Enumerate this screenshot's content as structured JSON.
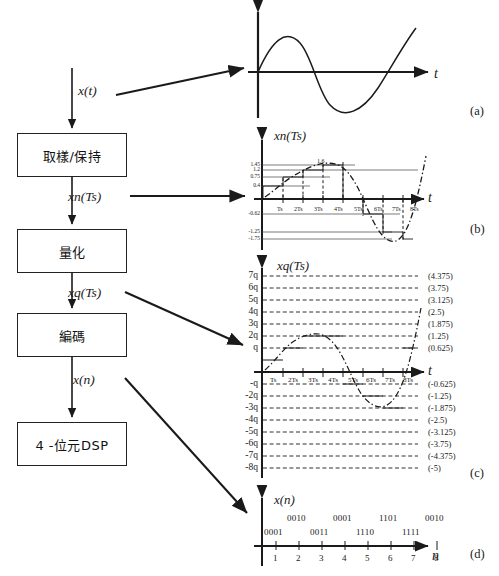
{
  "diagram": {
    "flow": {
      "input_signal_label": "x(t)",
      "blocks": [
        {
          "id": "sample-hold",
          "label": "取樣/保持"
        },
        {
          "id": "quantize",
          "label": "量化"
        },
        {
          "id": "encode",
          "label": "編碼"
        },
        {
          "id": "dsp",
          "label": "4 -位元DSP"
        }
      ],
      "edge_labels": [
        {
          "id": "xn",
          "label": "xn(Ts)"
        },
        {
          "id": "xq",
          "label": "xq(Ts)"
        },
        {
          "id": "xn_out",
          "label": "x(n)"
        }
      ]
    },
    "panels": [
      {
        "id": "a",
        "tag": "(a)",
        "title": "",
        "axis_x": "t",
        "axis_y": ""
      },
      {
        "id": "b",
        "tag": "(b)",
        "title": "xn(Ts)",
        "axis_x": "t",
        "axis_y": ""
      },
      {
        "id": "c",
        "tag": "(c)",
        "title": "xq(Ts)",
        "axis_x": "t",
        "axis_y": ""
      },
      {
        "id": "d",
        "tag": "(d)",
        "title": "x(n)",
        "axis_x": "n",
        "axis_y": ""
      }
    ]
  },
  "chart_data": [
    {
      "id": "a",
      "type": "line",
      "title": "",
      "xlabel": "t",
      "ylabel": "",
      "grid": false,
      "legend": null,
      "description": "Continuous-time analog sine-like waveform rising from origin",
      "x": [
        0,
        0.5,
        1,
        1.5,
        2,
        2.5,
        3,
        3.5,
        4,
        4.5,
        5,
        5.5,
        6,
        6.5,
        7,
        7.5,
        8
      ],
      "values": [
        0,
        0.55,
        1.0,
        1.35,
        1.5,
        1.35,
        0.95,
        0.25,
        -0.6,
        -1.3,
        -1.65,
        -1.5,
        -0.95,
        -0.1,
        0.95,
        2.1,
        3.1
      ]
    },
    {
      "id": "b",
      "type": "line",
      "title": "xn(Ts)",
      "xlabel": "t",
      "ylabel": "",
      "grid": false,
      "legend": null,
      "description": "Sample-and-hold staircase output overlaid on the dash-dot analog input",
      "categories": [
        "Ts",
        "2Ts",
        "3Ts",
        "4Ts",
        "5Ts",
        "6Ts",
        "7Ts",
        "8Ts"
      ],
      "sample_values": [
        0.4,
        0.75,
        1.2,
        1.45,
        1.6,
        -0.62,
        -1.25,
        -1.75
      ],
      "y_tick_labels": [
        "1.45",
        "1.2",
        "0.75",
        "0.4",
        "-0.62",
        "-1.25",
        "-1.75"
      ],
      "peak_annotation": "1.6"
    },
    {
      "id": "c",
      "type": "line",
      "title": "xq(Ts)",
      "xlabel": "t",
      "ylabel": "",
      "grid": true,
      "legend": null,
      "description": "Quantized staircase on a 16-level grid; left axis in q steps, right axis in volts",
      "categories": [
        "Ts",
        "2Ts",
        "3Ts",
        "4Ts",
        "5Ts",
        "6Ts",
        "7Ts",
        "8Ts"
      ],
      "levels_q": [
        "7q",
        "6q",
        "5q",
        "4q",
        "3q",
        "2q",
        "q",
        "-q",
        "-2q",
        "-3q",
        "-4q",
        "-5q",
        "-6q",
        "-7q",
        "-8q"
      ],
      "levels_v": [
        "(4.375)",
        "(3.75)",
        "(3.125)",
        "(2.5)",
        "(1.875)",
        "(1.25)",
        "(0.625)",
        "(-0.625)",
        "(-1.25)",
        "(-1.875)",
        "(-2.5)",
        "(-3.125)",
        "(-3.75)",
        "(-4.375)",
        "(-5)"
      ],
      "quantized_values_q": [
        1,
        2,
        3,
        3,
        -1,
        -2,
        -3,
        2
      ]
    },
    {
      "id": "d",
      "type": "table",
      "title": "x(n)",
      "xlabel": "n",
      "ylabel": "",
      "grid": false,
      "legend": null,
      "description": "4-bit binary code words versus sample index n",
      "categories": [
        "1",
        "2",
        "3",
        "4",
        "5",
        "6",
        "7",
        "8"
      ],
      "codes": [
        "0001",
        "0010",
        "0011",
        "0001",
        "1110",
        "1101",
        "1111",
        "0010"
      ]
    }
  ]
}
